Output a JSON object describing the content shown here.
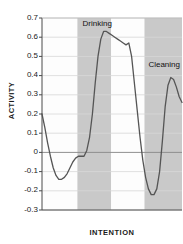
{
  "chart_data": {
    "type": "line",
    "title": "",
    "xlabel": "INTENTION",
    "ylabel": "ACTIVITY",
    "ylim": [
      -0.3,
      0.7
    ],
    "yticks": [
      "0.7",
      "0.6",
      "0.5",
      "0.4",
      "0.3",
      "0.2",
      "0.1",
      "0",
      "-0.1",
      "-0.2",
      "-0.3"
    ],
    "ytick_values": [
      0.7,
      0.6,
      0.5,
      0.4,
      0.3,
      0.2,
      0.1,
      0,
      -0.1,
      -0.2,
      -0.3
    ],
    "xticks": [],
    "xtick_labels": [],
    "grid": true,
    "grid_axis": "y",
    "zero_line": true,
    "legend": "none",
    "line_color": "#555555",
    "grid_color": "#d8d8d8",
    "zero_line_color": "#909090",
    "band_color": "#c9c9c9",
    "axis_color": "#4a4a4a",
    "plot_background": "#fdfdfd",
    "series": [
      {
        "name": "activity",
        "x": [
          0.0,
          0.02,
          0.04,
          0.06,
          0.08,
          0.1,
          0.12,
          0.14,
          0.16,
          0.18,
          0.2,
          0.22,
          0.24,
          0.26,
          0.28,
          0.3,
          0.32,
          0.34,
          0.36,
          0.38,
          0.4,
          0.42,
          0.44,
          0.46,
          0.48,
          0.5,
          0.52,
          0.54,
          0.56,
          0.58,
          0.6,
          0.62,
          0.64,
          0.66,
          0.68,
          0.7,
          0.72,
          0.74,
          0.76,
          0.78,
          0.8,
          0.82,
          0.84,
          0.86,
          0.88,
          0.9,
          0.92,
          0.94,
          0.96,
          0.98,
          1.0
        ],
        "y": [
          0.2,
          0.13,
          0.05,
          -0.02,
          -0.08,
          -0.12,
          -0.14,
          -0.14,
          -0.13,
          -0.11,
          -0.08,
          -0.05,
          -0.03,
          -0.02,
          -0.02,
          -0.02,
          0.01,
          0.08,
          0.2,
          0.36,
          0.5,
          0.59,
          0.63,
          0.63,
          0.62,
          0.61,
          0.6,
          0.59,
          0.58,
          0.57,
          0.56,
          0.57,
          0.5,
          0.36,
          0.22,
          0.08,
          -0.04,
          -0.13,
          -0.19,
          -0.22,
          -0.22,
          -0.19,
          -0.1,
          0.06,
          0.24,
          0.35,
          0.39,
          0.38,
          0.34,
          0.29,
          0.26
        ]
      }
    ],
    "bands": [
      {
        "label": "Drinking",
        "x_start": 0.253,
        "x_end": 0.493
      },
      {
        "label": "Cleaning",
        "x_start": 0.732,
        "x_end": 1.0
      }
    ],
    "annotations": [
      {
        "text": "Drinking",
        "x": 0.29,
        "y": 0.67
      },
      {
        "text": "Cleaning",
        "x": 0.76,
        "y": 0.455
      }
    ]
  }
}
